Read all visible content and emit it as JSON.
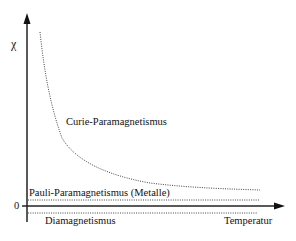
{
  "diagram": {
    "y_axis_label": "χ",
    "x_axis_label": "Temperatur",
    "zero_label": "0",
    "curves": [
      {
        "name": "Curie-Paramagnetismus",
        "style": "dotted",
        "shape": "hyperbola 1/T"
      },
      {
        "name": "Pauli-Paramagnetismus (Metalle)",
        "style": "dotted",
        "shape": "constant positive"
      },
      {
        "name": "Diamagnetismus",
        "style": "dotted",
        "shape": "constant negative"
      }
    ]
  }
}
